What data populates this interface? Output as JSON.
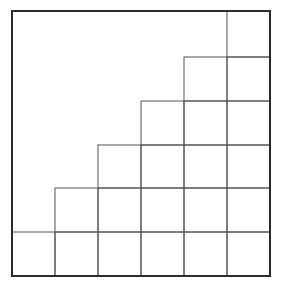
{
  "diagram": {
    "type": "staircase-grid",
    "grid_size": 6,
    "frame": {
      "x": 12,
      "y": 11,
      "width": 258,
      "height": 265
    },
    "column_x": [
      12,
      55,
      98,
      141,
      184,
      227,
      270
    ],
    "row_y": [
      11,
      57,
      101,
      145,
      188,
      232,
      276
    ],
    "rows": [
      {
        "row": 0,
        "filled_columns": [
          5
        ]
      },
      {
        "row": 1,
        "filled_columns": [
          4,
          5
        ]
      },
      {
        "row": 2,
        "filled_columns": [
          3,
          4,
          5
        ]
      },
      {
        "row": 3,
        "filled_columns": [
          2,
          3,
          4,
          5
        ]
      },
      {
        "row": 4,
        "filled_columns": [
          1,
          2,
          3,
          4,
          5
        ]
      },
      {
        "row": 5,
        "filled_columns": [
          0,
          1,
          2,
          3,
          4,
          5
        ]
      }
    ],
    "colors": {
      "background": "#ffffff",
      "frame_stroke": "#2b2b2b",
      "cell_stroke": "#555555"
    },
    "stroke_widths": {
      "frame": 2,
      "cell": 1
    }
  }
}
